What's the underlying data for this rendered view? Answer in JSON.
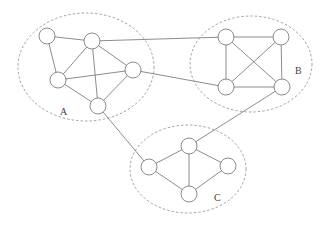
{
  "diagram": {
    "type": "clustered-graph",
    "colors": {
      "edge": "#6e6e6e",
      "node_fill": "#ffffff",
      "cluster_border": "#8a8a8a",
      "label": "#444444"
    },
    "node_radius": 8,
    "clusters": [
      {
        "id": "A",
        "label": "A",
        "cx": 86,
        "cy": 67,
        "rx": 68,
        "ry": 54,
        "label_x": 60,
        "label_y": 115
      },
      {
        "id": "B",
        "label": "B",
        "cx": 251,
        "cy": 64,
        "rx": 61,
        "ry": 48,
        "label_x": 295,
        "label_y": 74
      },
      {
        "id": "C",
        "label": "C",
        "cx": 188,
        "cy": 169,
        "rx": 58,
        "ry": 44,
        "label_x": 214,
        "label_y": 201
      }
    ],
    "nodes": [
      {
        "id": "A1",
        "cluster": "A",
        "x": 47,
        "y": 36
      },
      {
        "id": "A2",
        "cluster": "A",
        "x": 92,
        "y": 41
      },
      {
        "id": "A3",
        "cluster": "A",
        "x": 58,
        "y": 80
      },
      {
        "id": "A4",
        "cluster": "A",
        "x": 133,
        "y": 70
      },
      {
        "id": "A5",
        "cluster": "A",
        "x": 98,
        "y": 106
      },
      {
        "id": "B1",
        "cluster": "B",
        "x": 226,
        "y": 37
      },
      {
        "id": "B2",
        "cluster": "B",
        "x": 281,
        "y": 37
      },
      {
        "id": "B3",
        "cluster": "B",
        "x": 226,
        "y": 87
      },
      {
        "id": "B4",
        "cluster": "B",
        "x": 282,
        "y": 87
      },
      {
        "id": "C1",
        "cluster": "C",
        "x": 149,
        "y": 167
      },
      {
        "id": "C2",
        "cluster": "C",
        "x": 189,
        "y": 146
      },
      {
        "id": "C3",
        "cluster": "C",
        "x": 228,
        "y": 166
      },
      {
        "id": "C4",
        "cluster": "C",
        "x": 189,
        "y": 194
      }
    ],
    "edges": [
      [
        "A1",
        "A2"
      ],
      [
        "A1",
        "A3"
      ],
      [
        "A2",
        "A3"
      ],
      [
        "A2",
        "A5"
      ],
      [
        "A2",
        "A4"
      ],
      [
        "A3",
        "A4"
      ],
      [
        "A3",
        "A5"
      ],
      [
        "A4",
        "A5"
      ],
      [
        "B1",
        "B2"
      ],
      [
        "B1",
        "B3"
      ],
      [
        "B1",
        "B4"
      ],
      [
        "B2",
        "B3"
      ],
      [
        "B2",
        "B4"
      ],
      [
        "B3",
        "B4"
      ],
      [
        "C1",
        "C2"
      ],
      [
        "C1",
        "C4"
      ],
      [
        "C2",
        "C4"
      ],
      [
        "C2",
        "C3"
      ],
      [
        "C3",
        "C4"
      ],
      [
        "A2",
        "B1"
      ],
      [
        "A4",
        "B3"
      ],
      [
        "A5",
        "C1"
      ],
      [
        "B4",
        "C2"
      ]
    ]
  }
}
